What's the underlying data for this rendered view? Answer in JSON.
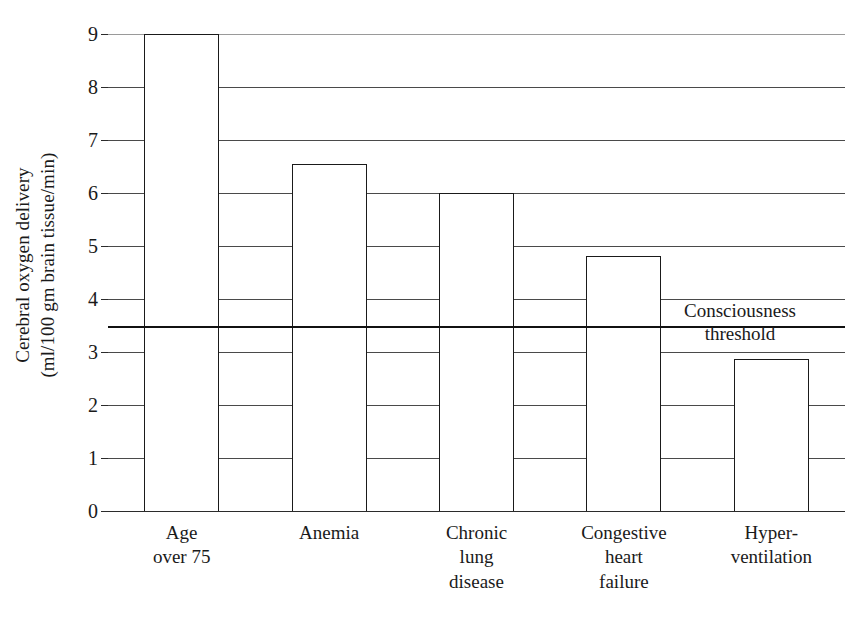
{
  "chart_data": {
    "type": "bar",
    "title": "",
    "subtitle": "",
    "xlabel": "",
    "ylabel": "Cerebral oxygen delivery (ml/100 gm brain tissue/min)",
    "ylabel_lines": [
      "Cerebral oxygen delivery",
      "(ml/100 gm brain tissue/min)"
    ],
    "categories": [
      "Age over 75",
      "Anemia",
      "Chronic lung disease",
      "Congestive heart failure",
      "Hyper-ventilation"
    ],
    "category_lines": [
      [
        "Age",
        "over 75"
      ],
      [
        "Anemia"
      ],
      [
        "Chronic",
        "lung",
        "disease"
      ],
      [
        "Congestive",
        "heart",
        "failure"
      ],
      [
        "Hyper-",
        "ventilation"
      ]
    ],
    "values": [
      9.0,
      6.55,
      6.0,
      4.82,
      2.87
    ],
    "ylim": [
      0,
      9
    ],
    "yticks": [
      0,
      1,
      2,
      3,
      4,
      5,
      6,
      7,
      8,
      9
    ],
    "ytick_labels": [
      "0",
      "1",
      "2",
      "3",
      "4",
      "5",
      "6",
      "7",
      "8",
      "9"
    ],
    "grid": true,
    "legend": "none",
    "annotations": [
      {
        "name": "consciousness-threshold",
        "lines": [
          "Consciousness",
          "threshold"
        ],
        "value": 3.5,
        "type": "horizontal-threshold-line"
      }
    ],
    "colors": {
      "bar_fill": "#ffffff",
      "bar_stroke": "#1a1a1a",
      "gridline": "#4a4a4a",
      "threshold": "#111111",
      "text": "#1a1a1a",
      "background": "#ffffff"
    }
  }
}
